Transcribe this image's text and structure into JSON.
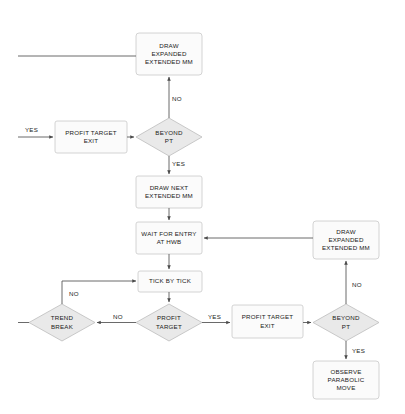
{
  "diagram": {
    "colors": {
      "process_fill": "#fbfbfb",
      "decision_fill": "#e9e9e9",
      "stroke": "#c9c9c9",
      "decision_stroke": "#bdbdbd",
      "line": "#595959",
      "text": "#1a1a1a",
      "background": "#ffffff"
    },
    "nodes": [
      {
        "id": "draw-expanded-extended-mm-top",
        "shape": "process",
        "label": "DRAW\nEXPANDED\nEXTENDED MM",
        "x": 136,
        "y": 33,
        "w": 66,
        "h": 42
      },
      {
        "id": "profit-target-exit-upper",
        "shape": "process",
        "label": "PROFIT TARGET\nEXIT",
        "x": 55,
        "y": 121,
        "w": 72,
        "h": 32
      },
      {
        "id": "beyond-pt-upper",
        "shape": "decision",
        "label": "BEYOND\nPT",
        "x": 136,
        "y": 118,
        "w": 66,
        "h": 38
      },
      {
        "id": "draw-next-extended-mm",
        "shape": "process",
        "label": "DRAW NEXT\nEXTENDED MM",
        "x": 136,
        "y": 176,
        "w": 66,
        "h": 32
      },
      {
        "id": "wait-for-entry-at-hwb",
        "shape": "process",
        "label": "WAIT FOR ENTRY\nAT HWB",
        "x": 136,
        "y": 222,
        "w": 66,
        "h": 32
      },
      {
        "id": "draw-expanded-extended-mm-right",
        "shape": "process",
        "label": "DRAW\nEXPANDED\nEXTENDED MM",
        "x": 313,
        "y": 221,
        "w": 66,
        "h": 38
      },
      {
        "id": "tick-by-tick",
        "shape": "process",
        "label": "TICK BY TICK",
        "x": 138,
        "y": 271,
        "w": 64,
        "h": 21
      },
      {
        "id": "trend-break",
        "shape": "decision",
        "label": "TREND\nBREAK",
        "x": 29,
        "y": 304,
        "w": 66,
        "h": 37
      },
      {
        "id": "profit-target",
        "shape": "decision",
        "label": "PROFIT\nTARGET",
        "x": 136,
        "y": 304,
        "w": 66,
        "h": 37
      },
      {
        "id": "profit-target-exit-lower",
        "shape": "process",
        "label": "PROFIT TARGET\nEXIT",
        "x": 232,
        "y": 305,
        "w": 71,
        "h": 33
      },
      {
        "id": "beyond-pt-lower",
        "shape": "decision",
        "label": "BEYOND\nPT",
        "x": 313,
        "y": 304,
        "w": 66,
        "h": 37
      },
      {
        "id": "observe-parabolic-move",
        "shape": "process",
        "label": "OBSERVE\nPARABOLIC\nMOVE",
        "x": 313,
        "y": 361,
        "w": 66,
        "h": 38
      }
    ],
    "edge_labels": [
      {
        "id": "no-top",
        "text": "NO",
        "x": 172,
        "y": 95
      },
      {
        "id": "yes-left-upper",
        "text": "YES",
        "x": 25,
        "y": 126
      },
      {
        "id": "yes-upper",
        "text": "YES",
        "x": 172,
        "y": 160
      },
      {
        "id": "no-loop-left",
        "text": "NO",
        "x": 69,
        "y": 290
      },
      {
        "id": "no-trend",
        "text": "NO",
        "x": 113,
        "y": 313
      },
      {
        "id": "yes-lower",
        "text": "YES",
        "x": 208,
        "y": 313
      },
      {
        "id": "no-right",
        "text": "NO",
        "x": 352,
        "y": 281
      },
      {
        "id": "yes-right",
        "text": "YES",
        "x": 352,
        "y": 347
      }
    ]
  }
}
